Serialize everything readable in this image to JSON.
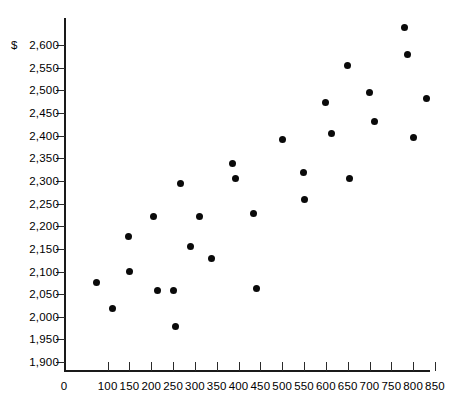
{
  "chart_data": {
    "type": "scatter",
    "title": "",
    "subtitle": "",
    "xlabel": "",
    "ylabel": "",
    "currency_symbol": "$",
    "grid": false,
    "legend": null,
    "xlim": [
      0,
      880
    ],
    "ylim": [
      1875,
      2625
    ],
    "x_ticks": [
      0,
      100,
      150,
      200,
      250,
      300,
      350,
      400,
      450,
      500,
      550,
      600,
      650,
      700,
      750,
      800,
      850
    ],
    "x_tick_labels": [
      "0",
      "100",
      "150",
      "200",
      "250",
      "300",
      "350",
      "400",
      "450",
      "500",
      "550",
      "600",
      "650",
      "700",
      "750",
      "800",
      "850"
    ],
    "y_ticks": [
      2600,
      2550,
      2500,
      2450,
      2400,
      2350,
      2300,
      2250,
      2200,
      2150,
      2100,
      2050,
      2000,
      1950,
      1900
    ],
    "y_tick_labels": [
      "2,600",
      "2,550",
      "2,500",
      "2,450",
      "2,400",
      "2,350",
      "2,300",
      "2,250",
      "2,200",
      "2,150",
      "2,100",
      "2,050",
      "2,000",
      "1,950",
      "1,900"
    ],
    "points": [
      {
        "x": 75,
        "y": 2075
      },
      {
        "x": 110,
        "y": 2018
      },
      {
        "x": 150,
        "y": 2100
      },
      {
        "x": 147,
        "y": 2178
      },
      {
        "x": 205,
        "y": 2222
      },
      {
        "x": 215,
        "y": 2057
      },
      {
        "x": 250,
        "y": 2057
      },
      {
        "x": 255,
        "y": 1978
      },
      {
        "x": 268,
        "y": 2295
      },
      {
        "x": 290,
        "y": 2155
      },
      {
        "x": 310,
        "y": 2222
      },
      {
        "x": 338,
        "y": 2128
      },
      {
        "x": 385,
        "y": 2338
      },
      {
        "x": 392,
        "y": 2305
      },
      {
        "x": 435,
        "y": 2228
      },
      {
        "x": 440,
        "y": 2063
      },
      {
        "x": 500,
        "y": 2392
      },
      {
        "x": 548,
        "y": 2318
      },
      {
        "x": 552,
        "y": 2258
      },
      {
        "x": 600,
        "y": 2472
      },
      {
        "x": 612,
        "y": 2405
      },
      {
        "x": 650,
        "y": 2555
      },
      {
        "x": 655,
        "y": 2305
      },
      {
        "x": 700,
        "y": 2495
      },
      {
        "x": 712,
        "y": 2432
      },
      {
        "x": 780,
        "y": 2638
      },
      {
        "x": 788,
        "y": 2580
      },
      {
        "x": 800,
        "y": 2395
      },
      {
        "x": 830,
        "y": 2483
      }
    ]
  }
}
